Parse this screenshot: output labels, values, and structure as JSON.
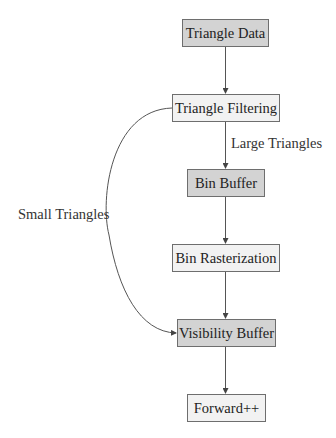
{
  "diagram": {
    "nodes": [
      {
        "id": "triangle-data",
        "label": "Triangle Data",
        "style": "dark"
      },
      {
        "id": "triangle-filtering",
        "label": "Triangle Filtering",
        "style": "light"
      },
      {
        "id": "bin-buffer",
        "label": "Bin Buffer",
        "style": "dark"
      },
      {
        "id": "bin-rasterization",
        "label": "Bin Rasterization",
        "style": "light"
      },
      {
        "id": "visibility-buffer",
        "label": "Visibility Buffer",
        "style": "dark"
      },
      {
        "id": "forward-plus-plus",
        "label": "Forward++",
        "style": "light"
      }
    ],
    "edges": [
      {
        "from": "triangle-data",
        "to": "triangle-filtering",
        "label": ""
      },
      {
        "from": "triangle-filtering",
        "to": "bin-buffer",
        "label": "Large Triangles"
      },
      {
        "from": "bin-buffer",
        "to": "bin-rasterization",
        "label": ""
      },
      {
        "from": "bin-rasterization",
        "to": "visibility-buffer",
        "label": ""
      },
      {
        "from": "triangle-filtering",
        "to": "visibility-buffer",
        "label": "Small Triangles"
      },
      {
        "from": "visibility-buffer",
        "to": "forward-plus-plus",
        "label": ""
      }
    ],
    "edge_labels": {
      "large": "Large Triangles",
      "small": "Small Triangles"
    },
    "colors": {
      "dark_fill": "#d3d3d3",
      "light_fill": "#f2f2f2",
      "border": "#6e6e6e",
      "edge": "#555555"
    }
  }
}
